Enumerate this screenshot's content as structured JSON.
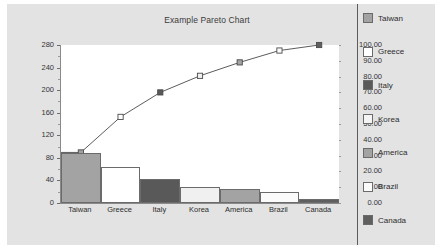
{
  "chart_data": {
    "type": "bar",
    "title": "Example Pareto Chart",
    "xlabel": "",
    "ylabel": "",
    "grid": false,
    "legend_position": "right",
    "categories": [
      "Taiwan",
      "Greece",
      "Italy",
      "Korea",
      "America",
      "Brazil",
      "Canada"
    ],
    "series": [
      {
        "name": "Count",
        "type": "bar",
        "axis": "left",
        "values": [
          89,
          63,
          43,
          29,
          24,
          20,
          7
        ]
      },
      {
        "name": "Cumulative %",
        "type": "line",
        "axis": "right",
        "values": [
          32.0,
          54.5,
          70.0,
          80.5,
          89.0,
          96.5,
          100.0
        ]
      }
    ],
    "left_axis": {
      "min": 0,
      "max": 280,
      "step": 40,
      "tick_labels": [
        "0",
        "40",
        "80",
        "120",
        "160",
        "200",
        "240",
        "280"
      ]
    },
    "right_axis": {
      "min": 0,
      "max": 100,
      "step": 10,
      "tick_labels": [
        "0.00",
        "10.00",
        "20.00",
        "30.00",
        "40.00",
        "50.00",
        "60.00",
        "70.00",
        "80.00",
        "90.00",
        "100.00"
      ]
    },
    "colors": {
      "Taiwan": "#a3a3a3",
      "Greece": "#ffffff",
      "Italy": "#595959",
      "Korea": "#f0f0f0",
      "America": "#a3a3a3",
      "Brazil": "#fbfbfb",
      "Canada": "#5f5f5f",
      "line": "#4a4a4a",
      "plot_background": "#ffffff",
      "chart_background": "#e3e3e3",
      "axis": "#8a8a8a"
    }
  },
  "legend": {
    "items": [
      {
        "label": "Taiwan",
        "color": "#a3a3a3"
      },
      {
        "label": "Greece",
        "color": "#ffffff"
      },
      {
        "label": "Italy",
        "color": "#595959"
      },
      {
        "label": "Korea",
        "color": "#f4f4f4"
      },
      {
        "label": "America",
        "color": "#a3a3a3"
      },
      {
        "label": "Brazil",
        "color": "#fbfbfb"
      },
      {
        "label": "Canada",
        "color": "#5f5f5f"
      }
    ]
  }
}
